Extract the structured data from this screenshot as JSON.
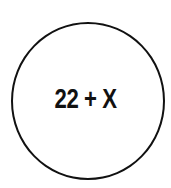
{
  "diagram": {
    "shape": "circle",
    "label": "22 + X",
    "colors": {
      "stroke": "#111111",
      "text": "#111111",
      "background": "#ffffff"
    }
  }
}
